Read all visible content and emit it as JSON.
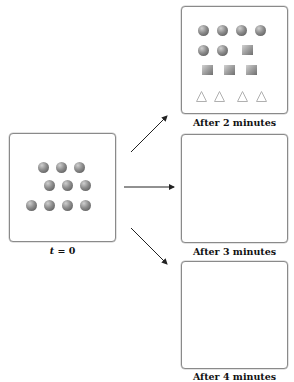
{
  "diagram": {
    "initial": {
      "label_var": "t",
      "label_rest": " = 0",
      "balls": [
        [
          52,
          34
        ],
        [
          70,
          34
        ],
        [
          88,
          34
        ],
        [
          58,
          52
        ],
        [
          76,
          52
        ],
        [
          94,
          52
        ],
        [
          40,
          72
        ],
        [
          58,
          72
        ],
        [
          76,
          72
        ],
        [
          94,
          72
        ]
      ]
    },
    "panels": [
      {
        "label": "After 2 minutes",
        "balls": [
          [
            16,
            18
          ],
          [
            35,
            18
          ],
          [
            54,
            18
          ],
          [
            73,
            18
          ],
          [
            16,
            38
          ],
          [
            35,
            38
          ]
        ],
        "cubes": [
          [
            60,
            38
          ],
          [
            20,
            58
          ],
          [
            42,
            58
          ],
          [
            64,
            58
          ]
        ],
        "cones": [
          [
            14,
            80
          ],
          [
            32,
            80
          ],
          [
            55,
            80
          ],
          [
            74,
            80
          ]
        ]
      },
      {
        "label": "After 3 minutes",
        "balls": [],
        "cubes": [],
        "cones": []
      },
      {
        "label": "After 4 minutes",
        "balls": [],
        "cubes": [],
        "cones": []
      }
    ],
    "arrows": [
      {
        "name": "arrow-to-2-min",
        "x1": 131,
        "y1": 152,
        "x2": 167,
        "y2": 116
      },
      {
        "name": "arrow-to-3-min",
        "x1": 124,
        "y1": 187,
        "x2": 174,
        "y2": 187
      },
      {
        "name": "arrow-to-4-min",
        "x1": 131,
        "y1": 228,
        "x2": 167,
        "y2": 264
      }
    ],
    "colors": {
      "border": "#8a8a8a",
      "arrow": "#222222",
      "cone_stroke": "#b0b0b0"
    }
  }
}
